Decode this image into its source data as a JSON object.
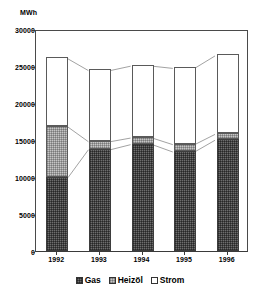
{
  "chart_data": {
    "type": "bar",
    "subtype": "stacked-column",
    "title": "",
    "xlabel": "",
    "ylabel": "MWh",
    "y_unit_label": "MWh",
    "categories": [
      "1992",
      "1993",
      "1994",
      "1995",
      "1996"
    ],
    "series": [
      {
        "name": "Gas",
        "values": [
          10000,
          13800,
          14500,
          13500,
          15100
        ]
      },
      {
        "name": "Heizöl",
        "values": [
          6900,
          1100,
          900,
          1000,
          800
        ]
      },
      {
        "name": "Strom",
        "values": [
          9300,
          9700,
          9800,
          10400,
          10700
        ]
      }
    ],
    "cumulative_tops": {
      "gas": [
        10000,
        13800,
        14500,
        13500,
        15100
      ],
      "heizoel": [
        16900,
        14900,
        15400,
        14500,
        15900
      ],
      "strom": [
        26200,
        24600,
        25200,
        24900,
        26600
      ]
    },
    "totals": [
      26200,
      24600,
      25200,
      24900,
      26600
    ],
    "ylim": [
      0,
      30000
    ],
    "yticks": [
      "0",
      "5000",
      "10000",
      "15000",
      "20000",
      "25000",
      "30000"
    ],
    "ytick_values": [
      0,
      5000,
      10000,
      15000,
      20000,
      25000,
      30000
    ],
    "grid": false,
    "legend_position": "bottom",
    "legend": [
      "Gas",
      "Heizöl",
      "Strom"
    ],
    "colors": {
      "gas": "#6e6e6e",
      "heizoel": "#c6c6c6",
      "strom": "#ffffff",
      "axis": "#3a3a3a",
      "text": "#000000"
    }
  }
}
